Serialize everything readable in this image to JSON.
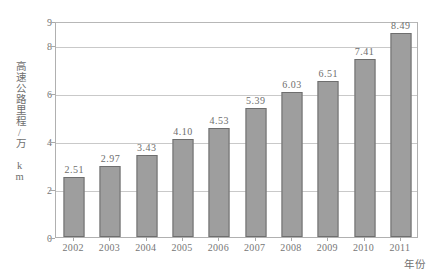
{
  "chart_data": {
    "type": "bar",
    "title": "",
    "xlabel": "年份",
    "ylabel": "高速公路里程/万 km",
    "categories": [
      "2002",
      "2003",
      "2004",
      "2005",
      "2006",
      "2007",
      "2008",
      "2009",
      "2010",
      "2011"
    ],
    "values": [
      2.51,
      2.97,
      3.43,
      4.1,
      4.53,
      5.39,
      6.03,
      6.51,
      7.41,
      8.49
    ],
    "value_labels": [
      "2.51",
      "2.97",
      "3.43",
      "4.10",
      "4.53",
      "5.39",
      "6.03",
      "6.51",
      "7.41",
      "8.49"
    ],
    "ylim": [
      0,
      9
    ],
    "yticks": [
      0,
      2,
      4,
      6,
      8,
      9
    ],
    "ytick_labels": [
      "0",
      "2",
      "4",
      "6",
      "8",
      "9"
    ],
    "gridlines": [
      2,
      4,
      6,
      8
    ],
    "grid": true,
    "legend": null,
    "legend_position": "none",
    "series": [
      {
        "name": "高速公路里程",
        "values": [
          2.51,
          2.97,
          3.43,
          4.1,
          4.53,
          5.39,
          6.03,
          6.51,
          7.41,
          8.49
        ]
      }
    ],
    "colors": {
      "bar_fill": "#9e9e9e",
      "bar_border": "#6e6e6e",
      "gridline": "#c9c9c9",
      "axis": "#b0b0b0",
      "text": "#6e6e6e",
      "background": "#ffffff"
    }
  }
}
